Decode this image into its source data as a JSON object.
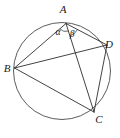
{
  "figure": {
    "type": "geometry-diagram",
    "canvas": {
      "width": 120,
      "height": 138
    },
    "background_color": "#ffffff",
    "stroke_color": "#2e2e2e",
    "circle_stroke_color": "#4a4a4a",
    "label_color": "#1a1a1a"
  },
  "circle": {
    "name": "circumscribed-circle",
    "center_x": 62,
    "center_y": 71,
    "radius": 48.5
  },
  "points": [
    {
      "id": "A",
      "label": "A",
      "x": 66,
      "y": 23.5,
      "label_x": 63,
      "label_y": 13
    },
    {
      "id": "B",
      "label": "B",
      "x": 14.5,
      "y": 68,
      "label_x": 7,
      "label_y": 72
    },
    {
      "id": "C",
      "label": "C",
      "x": 94,
      "y": 112,
      "label_x": 99,
      "label_y": 123
    },
    {
      "id": "D",
      "label": "D",
      "x": 107,
      "y": 45,
      "label_x": 109,
      "label_y": 48
    }
  ],
  "chords": [
    {
      "name": "chord-AB",
      "from": "A",
      "to": "B"
    },
    {
      "name": "chord-AC",
      "from": "A",
      "to": "C"
    },
    {
      "name": "chord-AD",
      "from": "A",
      "to": "D"
    },
    {
      "name": "chord-BD",
      "from": "B",
      "to": "D"
    },
    {
      "name": "chord-BC",
      "from": "B",
      "to": "C"
    },
    {
      "name": "chord-DC",
      "from": "D",
      "to": "C"
    }
  ],
  "angles": [
    {
      "id": "alpha",
      "label": "α",
      "vertex": "A",
      "between": [
        "B",
        "C"
      ],
      "label_x": 58,
      "label_y": 35,
      "arc_radius": 8
    },
    {
      "id": "beta",
      "label": "β",
      "vertex": "A",
      "between": [
        "C",
        "D"
      ],
      "label_x": 72,
      "label_y": 37,
      "arc_radius": 13
    }
  ]
}
